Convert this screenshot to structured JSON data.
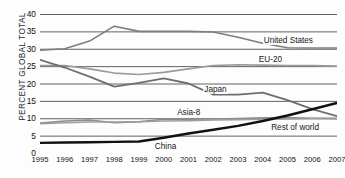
{
  "chart_data": {
    "type": "line",
    "title": "",
    "xlabel": "",
    "ylabel": "PERCENT GLOBAL TOTAL",
    "ylim": [
      0,
      40
    ],
    "ytick_step": 5,
    "yticks": [
      "0",
      "5",
      "10",
      "15",
      "20",
      "25",
      "30",
      "35",
      "40"
    ],
    "grid": true,
    "legend_position": "inline-labels",
    "x": [
      1995,
      1996,
      1997,
      1998,
      1999,
      2000,
      2001,
      2002,
      2003,
      2004,
      2005,
      2006,
      2007
    ],
    "categories": [
      "1995",
      "1996",
      "1997",
      "1998",
      "1999",
      "2000",
      "2001",
      "2002",
      "2003",
      "2004",
      "2005",
      "2006",
      "2007"
    ],
    "series": [
      {
        "name": "United States",
        "color": "#7d7d7d",
        "width": 1.6,
        "label_x": 2004.0,
        "label_y": 32.2,
        "values": [
          29.6,
          30.0,
          32.2,
          36.5,
          35.0,
          35.0,
          35.0,
          34.8,
          33.3,
          31.6,
          30.3,
          30.2,
          30.2
        ]
      },
      {
        "name": "EU-20",
        "color": "#9a9a9a",
        "width": 1.6,
        "label_x": 2003.8,
        "label_y": 26.9,
        "values": [
          25.2,
          25.2,
          24.2,
          23.0,
          22.6,
          23.2,
          24.2,
          25.2,
          25.4,
          25.3,
          25.2,
          25.2,
          25.0
        ]
      },
      {
        "name": "Japan",
        "color": "#6e6e6e",
        "width": 1.8,
        "label_x": 2001.6,
        "label_y": 18.2,
        "values": [
          26.8,
          24.6,
          22.0,
          19.1,
          20.2,
          21.5,
          20.0,
          16.8,
          16.8,
          17.4,
          15.2,
          12.6,
          10.6
        ]
      },
      {
        "name": "Asia-8",
        "color": "#8c8c8c",
        "width": 1.6,
        "label_x": 2000.5,
        "label_y": 11.6,
        "values": [
          8.6,
          9.2,
          9.5,
          8.7,
          9.0,
          9.7,
          9.7,
          9.8,
          9.9,
          10.1,
          10.2,
          10.0,
          9.9
        ]
      },
      {
        "name": "Rest of world",
        "color": "#9d9d9d",
        "width": 1.5,
        "label_x": 2004.3,
        "label_y": 7.3,
        "values": [
          8.4,
          8.7,
          8.9,
          8.9,
          9.0,
          9.2,
          9.3,
          9.5,
          9.6,
          9.7,
          9.8,
          9.9,
          10.0
        ]
      },
      {
        "name": "China",
        "color": "#111111",
        "width": 2.4,
        "label_x": 1999.6,
        "label_y": 1.6,
        "values": [
          2.9,
          3.0,
          3.1,
          3.2,
          3.3,
          4.4,
          5.6,
          6.7,
          7.8,
          9.2,
          10.8,
          12.6,
          14.4
        ]
      }
    ]
  }
}
